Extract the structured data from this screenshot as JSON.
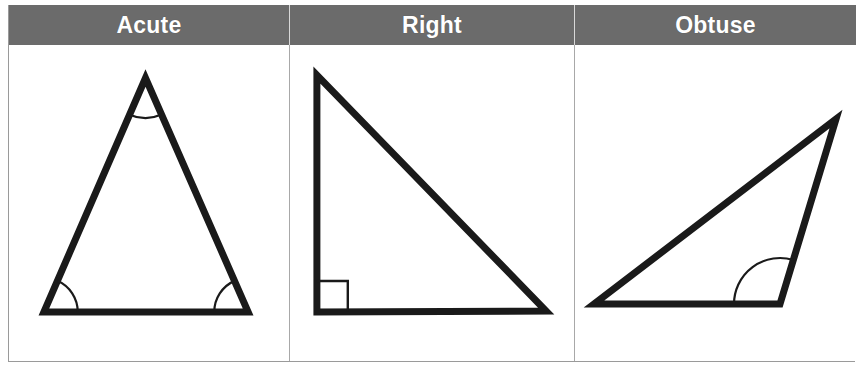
{
  "table": {
    "columns": [
      {
        "id": "acute",
        "header": "Acute",
        "figure": {
          "name": "acute-triangle",
          "type": "triangle",
          "vertices": [
            [
              137,
              33
            ],
            [
              35,
              267
            ],
            [
              240,
              267
            ]
          ],
          "angle_marks": [
            {
              "type": "arc",
              "at_vertex": 0,
              "radius": 40,
              "label": "acute-angle-arc-apex"
            },
            {
              "type": "arc",
              "at_vertex": 1,
              "radius": 34,
              "label": "acute-angle-arc-left"
            },
            {
              "type": "arc",
              "at_vertex": 2,
              "radius": 34,
              "label": "acute-angle-arc-right"
            }
          ]
        }
      },
      {
        "id": "right",
        "header": "Right",
        "figure": {
          "name": "right-triangle",
          "type": "triangle",
          "vertices": [
            [
              27,
              30
            ],
            [
              27,
              267
            ],
            [
              257,
              266
            ]
          ],
          "angle_marks": [
            {
              "type": "square",
              "at_vertex": 1,
              "size": 31,
              "label": "right-angle-square"
            }
          ]
        }
      },
      {
        "id": "obtuse",
        "header": "Obtuse",
        "figure": {
          "name": "obtuse-triangle",
          "type": "triangle",
          "vertices": [
            [
              261,
              74
            ],
            [
              19,
              259
            ],
            [
              205,
              259
            ]
          ],
          "angle_marks": [
            {
              "type": "arc",
              "at_vertex": 2,
              "radius": 46,
              "label": "obtuse-angle-arc"
            }
          ]
        }
      }
    ]
  },
  "colors": {
    "header_background": "#6b6b6b",
    "header_text": "#ffffff",
    "cell_background": "#ffffff",
    "border": "#9a9a9a",
    "stroke": "#1a1a1a"
  }
}
